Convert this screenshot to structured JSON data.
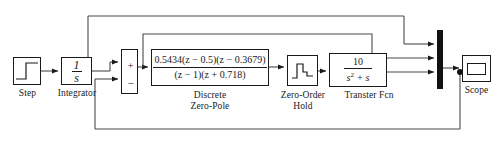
{
  "diagram": {
    "background": "#ffffff",
    "line_color": "#4a4a4a",
    "block_border_color": "#1a1a1a",
    "mux_color": "#111111"
  },
  "blocks": {
    "step": {
      "label": "Step",
      "icon": "step-signal-icon"
    },
    "integrator": {
      "label": "Integrator",
      "numerator": "1",
      "denominator": "s"
    },
    "sum": {
      "label": "",
      "plus_sign": "+",
      "minus_sign": "−",
      "icon": "sum-block-icon"
    },
    "discrete_zero_pole": {
      "label": "Discrete\nZero-Pole",
      "numerator": "0.5434(z − 0.5)(z − 0.3679)",
      "denominator": "(z − 1)(z + 0.718)"
    },
    "zero_order_hold": {
      "label": "Zero-Order\nHold",
      "icon": "staircase-hold-icon"
    },
    "transfer_fcn": {
      "label": "Transter Fcn",
      "numerator": "10",
      "denominator_base": "s",
      "denominator_exp": "2",
      "denominator_tail": " + s"
    },
    "mux": {
      "label": "",
      "icon": "mux-bar-icon",
      "input_count": 3
    },
    "scope": {
      "label": "Scope",
      "icon": "scope-screen-icon"
    }
  }
}
